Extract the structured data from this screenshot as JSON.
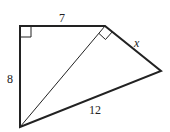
{
  "diagram": {
    "type": "geometry-figure",
    "vertices": {
      "top_left": [
        20,
        26
      ],
      "top_right": [
        105,
        26
      ],
      "right": [
        161,
        71
      ],
      "bottom_left": [
        20,
        127
      ]
    },
    "labels": {
      "top": "7",
      "left": "8",
      "right_side": "x",
      "bottom": "12"
    },
    "right_angles": [
      "top_left",
      "top_right (between diagonal and side x)"
    ],
    "colors": {
      "line": "#222222",
      "background": "#ffffff"
    }
  }
}
